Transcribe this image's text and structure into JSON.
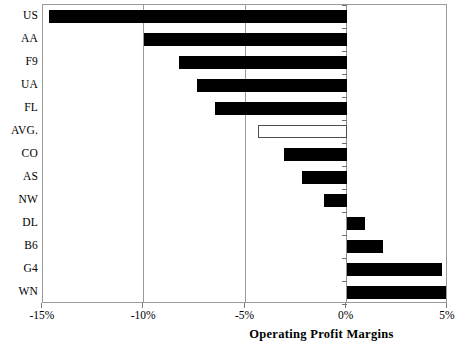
{
  "chart_data": {
    "type": "bar",
    "orientation": "horizontal",
    "title": "",
    "xlabel": "Operating Profit Margins",
    "ylabel": "",
    "xlim": [
      -15,
      5
    ],
    "xticks": [
      -15,
      -10,
      -5,
      0,
      5
    ],
    "xtick_labels": [
      "-15%",
      "-10%",
      "-5%",
      "0%",
      "5%"
    ],
    "grid": true,
    "gridlines_at": [
      -10,
      -5,
      0
    ],
    "legend": null,
    "categories": [
      "US",
      "AA",
      "F9",
      "UA",
      "FL",
      "AVG.",
      "CO",
      "AS",
      "NW",
      "DL",
      "B6",
      "G4",
      "WN"
    ],
    "values": [
      -14.7,
      -10.0,
      -8.3,
      -7.4,
      -6.5,
      -4.4,
      -3.1,
      -2.2,
      -1.1,
      0.9,
      1.8,
      4.7,
      4.9
    ],
    "bar_styles": [
      "filled",
      "filled",
      "filled",
      "filled",
      "filled",
      "hollow",
      "filled",
      "filled",
      "filled",
      "filled",
      "filled",
      "filled",
      "filled"
    ],
    "colors": {
      "bar_fill": "#000000",
      "bar_hollow_fill": "#ffffff",
      "bar_hollow_stroke": "#4d4d4d",
      "axis": "#9a9a9a",
      "background": "#ffffff",
      "text": "#000000"
    }
  }
}
